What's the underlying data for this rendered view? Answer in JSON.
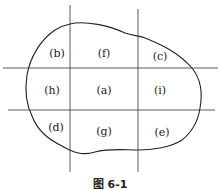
{
  "figure": {
    "caption": "图 6-1",
    "regions": [
      {
        "id": "b",
        "label": "(b)",
        "x": 57,
        "y": 53
      },
      {
        "id": "f",
        "label": "(f)",
        "x": 104,
        "y": 53
      },
      {
        "id": "c",
        "label": "(c)",
        "x": 160,
        "y": 56
      },
      {
        "id": "h",
        "label": "(h)",
        "x": 52,
        "y": 90
      },
      {
        "id": "a",
        "label": "(a)",
        "x": 104,
        "y": 90
      },
      {
        "id": "i",
        "label": "(i)",
        "x": 160,
        "y": 90
      },
      {
        "id": "d",
        "label": "(d)",
        "x": 56,
        "y": 127
      },
      {
        "id": "g",
        "label": "(g)",
        "x": 104,
        "y": 131
      },
      {
        "id": "e",
        "label": "(e)",
        "x": 162,
        "y": 132
      }
    ],
    "labels": {
      "b": "(b)",
      "f": "(f)",
      "c": "(c)",
      "h": "(h)",
      "a": "(a)",
      "i": "(i)",
      "d": "(d)",
      "g": "(g)",
      "e": "(e)"
    }
  }
}
